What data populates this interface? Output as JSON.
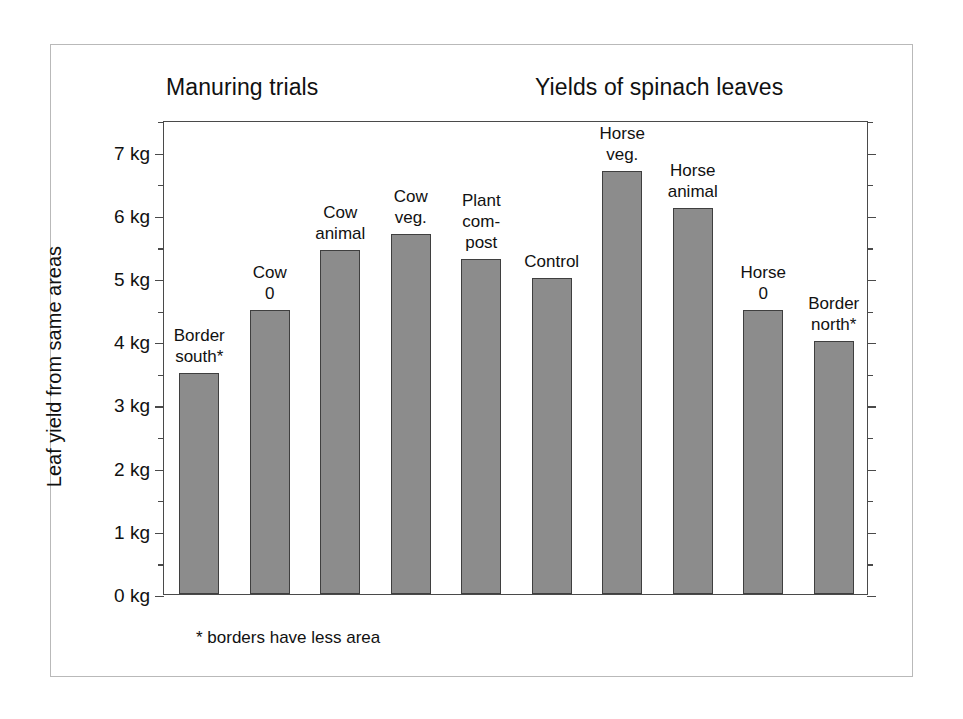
{
  "figure": {
    "title_left": "Manuring trials",
    "title_right": "Yields of spinach leaves",
    "footnote": "* borders have less area",
    "bar_fill_color": "#8c8c8c",
    "bar_edge_color": "#3f3f3f",
    "axis_color": "#4a4a4a",
    "frame_color": "#b9b9b9",
    "background_color": "#ffffff"
  },
  "chart_data": {
    "type": "bar",
    "xlabel": "",
    "ylabel": "Leaf yield from same areas",
    "ylim": [
      0,
      7.5
    ],
    "y_unit": "kg",
    "grid": false,
    "legend": null,
    "y_major_step": 1,
    "y_minor_step": 0.5,
    "y_tick_labels": [
      "7 kg",
      "6 kg",
      "5 kg",
      "4 kg",
      "3 kg",
      "2 kg",
      "1 kg",
      "0 kg"
    ],
    "y_tick_values": [
      7,
      6,
      5,
      4,
      3,
      2,
      1,
      0
    ],
    "categories": [
      "Border south*",
      "Cow 0",
      "Cow animal",
      "Cow veg.",
      "Plant com-post",
      "Control",
      "Horse veg.",
      "Horse animal",
      "Horse 0",
      "Border north*"
    ],
    "values": [
      3.5,
      4.5,
      5.45,
      5.7,
      5.3,
      5.0,
      6.7,
      6.1,
      4.5,
      4.0
    ],
    "bars": [
      {
        "label_lines": [
          "Border",
          "south*"
        ],
        "value": 3.5
      },
      {
        "label_lines": [
          "Cow",
          "0"
        ],
        "value": 4.5
      },
      {
        "label_lines": [
          "Cow",
          "animal"
        ],
        "value": 5.45
      },
      {
        "label_lines": [
          "Cow",
          "veg."
        ],
        "value": 5.7
      },
      {
        "label_lines": [
          "Plant",
          "com-",
          "post"
        ],
        "value": 5.3
      },
      {
        "label_lines": [
          "Control"
        ],
        "value": 5.0
      },
      {
        "label_lines": [
          "Horse",
          "veg."
        ],
        "value": 6.7
      },
      {
        "label_lines": [
          "Horse",
          "animal"
        ],
        "value": 6.1
      },
      {
        "label_lines": [
          "Horse",
          "0"
        ],
        "value": 4.5
      },
      {
        "label_lines": [
          "Border",
          "north*"
        ],
        "value": 4.0
      }
    ],
    "annotations": [
      "* borders have less area"
    ]
  }
}
